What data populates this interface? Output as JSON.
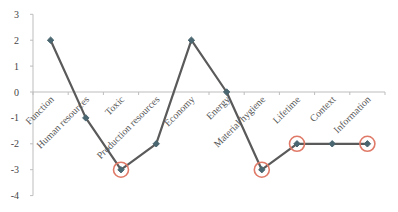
{
  "chart_data": {
    "type": "line",
    "title": "",
    "xlabel": "",
    "ylabel": "",
    "categories": [
      "Function",
      "Human resources",
      "Toxic",
      "Production resources",
      "Economy",
      "Energy",
      "Material hygiene",
      "Lifetime",
      "Context",
      "Information"
    ],
    "series": [
      {
        "name": "Score",
        "values": [
          2,
          -1,
          -3,
          -2,
          2,
          0,
          -3,
          -2,
          -2,
          -2
        ]
      }
    ],
    "highlighted": [
      "Toxic",
      "Material hygiene",
      "Lifetime",
      "Information"
    ],
    "ylim": [
      -4,
      3
    ],
    "yticks": [
      3,
      2,
      1,
      0,
      -1,
      -2,
      -3,
      -4
    ],
    "grid": false,
    "legend": "none",
    "colors": {
      "line": "#5a5a5a",
      "marker": "#4a6670",
      "highlight": "#e07a68",
      "axis": "#bdbdbd"
    }
  }
}
